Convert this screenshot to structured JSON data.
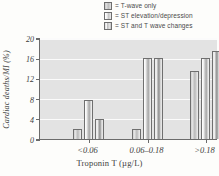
{
  "legend": {
    "items": [
      {
        "swatch": "legend-swatch-t-wave-only",
        "label": "= T-wave only"
      },
      {
        "swatch": "legend-swatch-st-elevation-depression",
        "label": "= ST elevation/depression"
      },
      {
        "swatch": "legend-swatch-st-and-t-wave-changes",
        "label": "= ST and T wave changes"
      }
    ]
  },
  "chart_data": {
    "type": "bar",
    "title": "",
    "xlabel": "Troponin T (µg/L)",
    "ylabel": "Cardiac deaths/MI (%)",
    "categories": [
      "<0.06",
      "0.06–0.18",
      ">0.18"
    ],
    "series": [
      {
        "name": "T-wave only",
        "values": [
          2,
          2,
          13.5
        ]
      },
      {
        "name": "ST elevation/depression",
        "values": [
          7.8,
          16,
          16
        ]
      },
      {
        "name": "ST and T wave changes",
        "values": [
          4,
          16,
          17.5
        ]
      }
    ],
    "ylim": [
      0,
      20
    ],
    "yticks": [
      0,
      4,
      8,
      12,
      16,
      20
    ],
    "ytick_labels": [
      "0",
      "4",
      "8",
      "12",
      "16",
      "20"
    ],
    "grid": true,
    "legend_position": "top-right",
    "colors": {
      "plot_background": "#e3e3e3",
      "gridline": "#fbfbfb",
      "axis": "#6b6b6b",
      "bar_outline": "#6f6f6f",
      "text": "#3d3d3d"
    }
  }
}
